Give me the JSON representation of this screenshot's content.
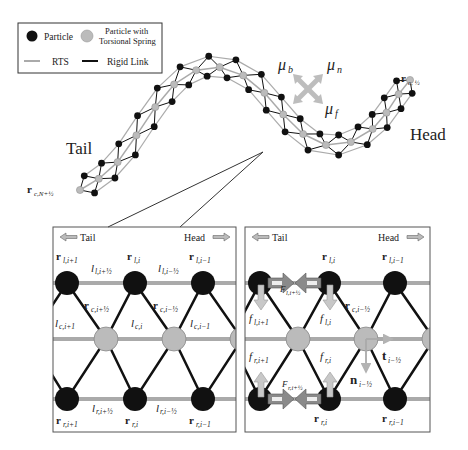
{
  "legend": {
    "particle": "Particle",
    "particle_torsional_line1": "Particle with",
    "particle_torsional_line2": "Torsional Spring",
    "rts": "RTS",
    "rigid_link": "Rigid Link"
  },
  "overview": {
    "tail_label": "Tail",
    "head_label": "Head",
    "head_point": "r",
    "head_point_sub": "c, ½",
    "tail_point": "r",
    "tail_point_sub": "c,N+½",
    "friction": {
      "mu_b": "μ",
      "mu_b_sub": "b",
      "mu_n": "μ",
      "mu_n_sub": "n",
      "mu_f": "μ",
      "mu_f_sub": "f"
    }
  },
  "left_panel": {
    "tail": "Tail",
    "head": "Head",
    "top_nodes": [
      {
        "main": "r",
        "sub": "l,i+1"
      },
      {
        "main": "r",
        "sub": "l,i"
      },
      {
        "main": "r",
        "sub": "l,i−1"
      }
    ],
    "top_links": [
      {
        "main": "l",
        "sub": "l,i+½"
      },
      {
        "main": "l",
        "sub": "l,i−½"
      }
    ],
    "center_nodes": [
      {
        "main": "r",
        "sub": "c,i+½"
      },
      {
        "main": "r",
        "sub": "c,i−½"
      }
    ],
    "center_links": [
      {
        "main": "l",
        "sub": "c,i+1"
      },
      {
        "main": "l",
        "sub": "c,i"
      },
      {
        "main": "l",
        "sub": "c,i−1"
      }
    ],
    "bottom_links": [
      {
        "main": "l",
        "sub": "r,i+½"
      },
      {
        "main": "l",
        "sub": "r,i−½"
      }
    ],
    "bottom_nodes": [
      {
        "main": "r",
        "sub": "r,i+1"
      },
      {
        "main": "r",
        "sub": "r,i"
      },
      {
        "main": "r",
        "sub": "r,i−1"
      }
    ]
  },
  "right_panel": {
    "tail": "Tail",
    "head": "Head",
    "top_nodes": [
      {
        "main": "r",
        "sub": "l,i"
      },
      {
        "main": "r",
        "sub": "l,i−1"
      }
    ],
    "center_node": {
      "main": "r",
      "sub": "c,i−½"
    },
    "forces": {
      "F_top": {
        "main": "F",
        "sub": "l,i+½"
      },
      "F_bottom": {
        "main": "F",
        "sub": "r,i+½"
      },
      "f_top_1": {
        "main": "f",
        "sub": "l,i+1"
      },
      "f_top_2": {
        "main": "f",
        "sub": "l,i"
      },
      "f_bot_1": {
        "main": "f",
        "sub": "r,i+1"
      },
      "f_bot_2": {
        "main": "f",
        "sub": "r,i"
      }
    },
    "tangent": {
      "main": "t",
      "sub": "i−½"
    },
    "normal": {
      "main": "n",
      "sub": "i−½"
    },
    "bottom_nodes": [
      {
        "main": "r",
        "sub": "r,i"
      },
      {
        "main": "r",
        "sub": "r,i−1"
      }
    ]
  },
  "colors": {
    "particle": "#111111",
    "torsional": "#b8b8b8",
    "rts": "#a9a9a9",
    "rigid": "#111111",
    "arrow_fill": "#c4c4c4",
    "arrow_dark": "#777777",
    "frame": "#555555"
  }
}
